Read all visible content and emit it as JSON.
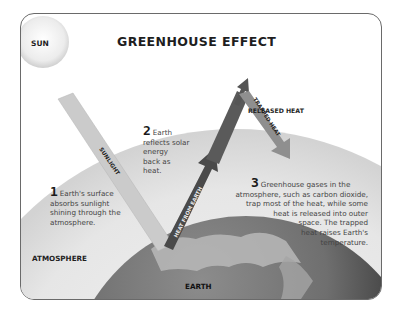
{
  "diagram": {
    "title": "GREENHOUSE EFFECT",
    "labels": {
      "sun": "SUN",
      "atmosphere": "ATMOSPHERE",
      "earth": "EARTH",
      "released_heat": "RELEASED HEAT"
    },
    "arrows": {
      "sunlight": "SUNLIGHT",
      "heat_from_earth": "HEAT FROM EARTH",
      "trapped_heat": "TRAPPED HEAT",
      "released_heat": "RELEASED HEAT"
    },
    "steps": [
      {
        "number": "1",
        "lines": [
          "Earth's surface",
          "absorbs sunlight",
          "shining through the",
          "atmosphere."
        ]
      },
      {
        "number": "2",
        "lines": [
          "Earth",
          "reflects solar",
          "energy",
          "back as",
          "heat."
        ]
      },
      {
        "number": "3",
        "lines": [
          "Greenhouse gases in the",
          "atmosphere, such as carbon dioxide,",
          "trap most of the heat, while some",
          "heat is released into outer",
          "space. The trapped",
          "heat raises Earth's",
          "temperature."
        ]
      }
    ],
    "colors": {
      "frame_border": "#6a6a6a",
      "atmosphere": "#d9d9d9",
      "sunlight_beam": "#c8c8c8",
      "heat_arrow": "#4a4a4a",
      "trapped_arrow": "#8a8a8a",
      "earth": "#7a7a7a"
    }
  }
}
